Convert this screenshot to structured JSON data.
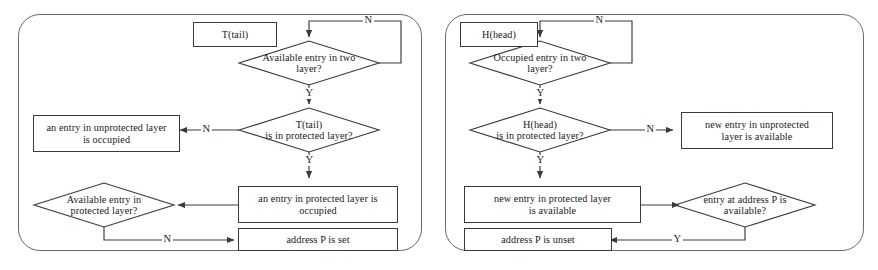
{
  "figure": {
    "panel_count": 2,
    "line_color": "#3a3a3a",
    "panel_border_color": "#6b6b6b",
    "background": "#ffffff"
  },
  "panels": [
    {
      "id": "tail",
      "start_label": "T(tail)",
      "nodes": [
        {
          "key": "start",
          "type": "box",
          "text": "T(tail)"
        },
        {
          "key": "d1",
          "type": "diamond",
          "text": "Available entry in two layer?"
        },
        {
          "key": "d2",
          "type": "diamond",
          "text": "T(tail)\nis in protected layer?"
        },
        {
          "key": "unprot_occ",
          "type": "box",
          "text": "an entry in unprotected layer is occupied"
        },
        {
          "key": "prot_occ",
          "type": "box",
          "text": "an entry in protected layer is occupied"
        },
        {
          "key": "d3",
          "type": "diamond",
          "text": "Available entry in protected layer?"
        },
        {
          "key": "addr_set",
          "type": "box",
          "text": "address P is set"
        }
      ],
      "edge_labels": {
        "d1_no": "N",
        "d1_yes": "Y",
        "d2_no": "N",
        "d2_yes": "Y",
        "d3_no": "N"
      }
    },
    {
      "id": "head",
      "start_label": "H(head)",
      "nodes": [
        {
          "key": "start",
          "type": "box",
          "text": "H(head)"
        },
        {
          "key": "d1",
          "type": "diamond",
          "text": "Occupied entry in two layer?"
        },
        {
          "key": "d2",
          "type": "diamond",
          "text": "H(head)\nis in protected layer?"
        },
        {
          "key": "unprot_avail",
          "type": "box",
          "text": "new entry  in unprotected layer is available"
        },
        {
          "key": "prot_avail",
          "type": "box",
          "text": "new entry  in protected layer is available"
        },
        {
          "key": "d3",
          "type": "diamond",
          "text": "entry at address P is available?"
        },
        {
          "key": "addr_unset",
          "type": "box",
          "text": "address P is unset"
        }
      ],
      "edge_labels": {
        "d1_no": "N",
        "d1_yes": "Y",
        "d2_no": "N",
        "d2_yes": "Y",
        "d3_yes": "Y"
      }
    }
  ],
  "left": {
    "start": "T(tail)",
    "d1_line1": "Available entry in two",
    "d1_line2": "layer?",
    "d2_line1": "T(tail)",
    "d2_line2": "is in protected layer?",
    "unprot_occ_line1": "an entry in unprotected layer",
    "unprot_occ_line2": "is occupied",
    "prot_occ_line1": "an entry in protected layer is",
    "prot_occ_line2": "occupied",
    "d3_line1": "Available entry in",
    "d3_line2": "protected layer?",
    "addr_set": "address P is set",
    "n1": "N",
    "y1": "Y",
    "n2": "N",
    "y2": "Y",
    "n3": "N"
  },
  "right": {
    "start": "H(head)",
    "d1_line1": "Occupied entry in two",
    "d1_line2": "layer?",
    "d2_line1": "H(head)",
    "d2_line2": "is in protected layer?",
    "unprot_avail_line1": "new entry  in unprotected",
    "unprot_avail_line2": "layer is available",
    "prot_avail_line1": "new entry  in protected layer",
    "prot_avail_line2": "is available",
    "d3_line1": "entry at address P is",
    "d3_line2": "available?",
    "addr_unset": "address P is unset",
    "n1": "N",
    "y1": "Y",
    "n2": "N",
    "y2": "Y",
    "y3": "Y"
  }
}
